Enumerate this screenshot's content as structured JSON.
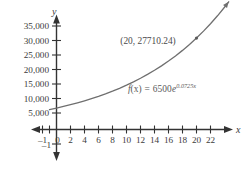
{
  "chart_data": {
    "type": "line",
    "title": "",
    "subtitle": "",
    "xlabel": "x",
    "ylabel": "y",
    "function_label": "f(x) = 6500e^{0.0725x}",
    "function_parts": {
      "fx": "f",
      "paren_x": "(x)",
      "equals": "=",
      "coefficient": "6500",
      "base": "e",
      "exponent": "0.0725x"
    },
    "equation": {
      "coefficient": 6500,
      "rate": 0.0725,
      "form": "a*e^(k*x)"
    },
    "xlim": [
      -1.8,
      25.8
    ],
    "ylim": [
      -2500,
      38500
    ],
    "xticks": [
      -1,
      0,
      2,
      4,
      6,
      8,
      10,
      12,
      14,
      16,
      18,
      20,
      22,
      24
    ],
    "xtick_labels": [
      "–1",
      "0",
      "2",
      "4",
      "6",
      "8",
      "10",
      "12",
      "14",
      "16",
      "18",
      "20",
      "22",
      "24"
    ],
    "yticks": [
      5000,
      10000,
      15000,
      20000,
      25000,
      30000,
      35000
    ],
    "ytick_labels": [
      "5,000",
      "10,000",
      "15,000",
      "20,000",
      "25,000",
      "30,000",
      "35,000"
    ],
    "negative_y_tick_label": "–1",
    "negative_y_tick_value": -1,
    "grid": false,
    "legend": null,
    "axis_arrows": [
      "up",
      "down",
      "left",
      "right"
    ],
    "curve_color": "#6f6f6f",
    "axis_color": "#333333",
    "text_color": "#3b3b3b",
    "annotations": [
      {
        "name": "point-label",
        "text": "(20, 27710.24)",
        "point_x": 20,
        "point_y": 27710.24,
        "marker": true
      },
      {
        "name": "equation-label",
        "text": "f(x) = 6500e^{0.0725x}",
        "x": 12.2,
        "y": 14200
      }
    ],
    "series": [
      {
        "name": "f(x) = 6500e^{0.0725x}",
        "x": [
          -1,
          0,
          1,
          2,
          3,
          4,
          5,
          6,
          7,
          8,
          9,
          10,
          11,
          12,
          13,
          14,
          15,
          16,
          17,
          18,
          19,
          20,
          21,
          22,
          23,
          24,
          24.6
        ],
        "values": [
          6045.4,
          6500.0,
          6989.0,
          7514.8,
          8080.1,
          8687.9,
          9341.3,
          10043.9,
          10799.4,
          11611.9,
          12485.3,
          13424.5,
          14434.1,
          15519.6,
          16686.5,
          17941.2,
          19290.1,
          20740.4,
          22299.8,
          23976.6,
          25779.6,
          27718.2,
          29802.6,
          32044.1,
          34454.8,
          37047.8,
          38703.5
        ]
      }
    ]
  },
  "figure": {
    "background": "#ffffff"
  }
}
